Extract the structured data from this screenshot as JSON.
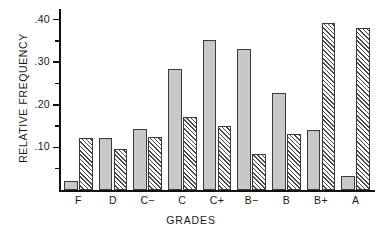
{
  "chart_data": {
    "type": "bar",
    "title": "",
    "xlabel": "GRADES",
    "ylabel": "RELATIVE FREQUENCY",
    "categories": [
      "F",
      "D",
      "C−",
      "C",
      "C+",
      "B−",
      "B",
      "B+",
      "A"
    ],
    "series": [
      {
        "name": "solid-gray",
        "style": "solid",
        "color": "#c8c8c8",
        "values": [
          0.022,
          0.122,
          0.142,
          0.284,
          0.353,
          0.33,
          0.228,
          0.141,
          0.034
        ]
      },
      {
        "name": "hatched",
        "style": "diagonal-hatch",
        "color": "#ffffff",
        "values": [
          0.123,
          0.097,
          0.125,
          0.172,
          0.15,
          0.084,
          0.132,
          0.393,
          0.38
        ]
      }
    ],
    "ylim": [
      0,
      0.42
    ],
    "ytick_labels": [
      ".40",
      ".30",
      ".20",
      ".10"
    ],
    "ytick_values": [
      0.4,
      0.3,
      0.2,
      0.1
    ],
    "yminor_values": [
      0.35,
      0.25,
      0.15,
      0.05
    ],
    "grid": false,
    "legend": "none"
  },
  "axis": {
    "y_title": "RELATIVE FREQUENCY",
    "x_title": "GRADES"
  }
}
